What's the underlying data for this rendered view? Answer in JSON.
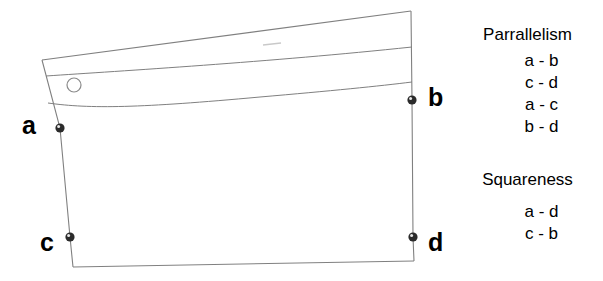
{
  "figure": {
    "background_color": "#ffffff",
    "line_color": "#808080",
    "marker_color": "#222222",
    "text_color": "#000000",
    "vertex_labels": {
      "a": "a",
      "b": "b",
      "c": "c",
      "d": "d"
    },
    "shape_name": "panel-outline",
    "hole_name": "locating-hole"
  },
  "legend": {
    "groups": [
      {
        "heading": "Parrallelism",
        "items": [
          "a - b",
          "c - d",
          "a - c",
          "b - d"
        ]
      },
      {
        "heading": "Squareness",
        "items": [
          "a - d",
          "c - b"
        ]
      }
    ]
  }
}
